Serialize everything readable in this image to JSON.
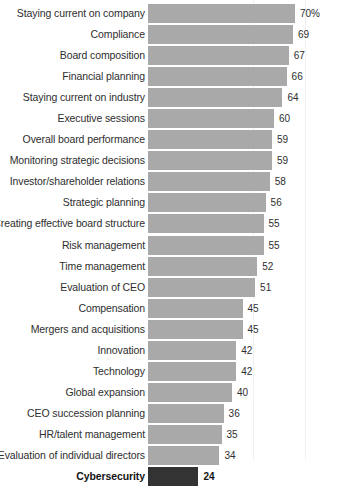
{
  "chart_data": {
    "type": "bar",
    "orientation": "horizontal",
    "title": "",
    "xlabel": "",
    "ylabel": "",
    "xlim": [
      0,
      70
    ],
    "grid": false,
    "legend": false,
    "value_suffix_first": "%",
    "highlight_category": "Cybersecurity",
    "colors": {
      "bar": "#a9a9a9",
      "bar_highlight": "#333333",
      "label_text": "#2e2e2e",
      "value_text": "#2e2e2e",
      "background": "#ffffff"
    },
    "categories": [
      "Staying current on company",
      "Compliance",
      "Board composition",
      "Financial planning",
      "Staying current on industry",
      "Executive sessions",
      "Overall board performance",
      "Monitoring strategic decisions",
      "Investor/shareholder relations",
      "Strategic planning",
      "Creating effective board structure",
      "Risk management",
      "Time management",
      "Evaluation of CEO",
      "Compensation",
      "Mergers and acquisitions",
      "Innovation",
      "Technology",
      "Global expansion",
      "CEO succession planning",
      "HR/talent management",
      "Evaluation of individual directors",
      "Cybersecurity"
    ],
    "values": [
      70,
      69,
      67,
      66,
      64,
      60,
      59,
      59,
      58,
      56,
      55,
      55,
      52,
      51,
      45,
      45,
      42,
      42,
      40,
      36,
      35,
      34,
      24
    ],
    "value_labels": [
      "70%",
      "69",
      "67",
      "66",
      "64",
      "60",
      "59",
      "59",
      "58",
      "56",
      "55",
      "55",
      "52",
      "51",
      "45",
      "45",
      "42",
      "42",
      "40",
      "36",
      "35",
      "34",
      "24"
    ]
  },
  "rows": [
    {
      "label": "Staying current on company",
      "value": 70,
      "value_label": "70%",
      "highlight": false
    },
    {
      "label": "Compliance",
      "value": 69,
      "value_label": "69",
      "highlight": false
    },
    {
      "label": "Board composition",
      "value": 67,
      "value_label": "67",
      "highlight": false
    },
    {
      "label": "Financial planning",
      "value": 66,
      "value_label": "66",
      "highlight": false
    },
    {
      "label": "Staying current on industry",
      "value": 64,
      "value_label": "64",
      "highlight": false
    },
    {
      "label": "Executive sessions",
      "value": 60,
      "value_label": "60",
      "highlight": false
    },
    {
      "label": "Overall board performance",
      "value": 59,
      "value_label": "59",
      "highlight": false
    },
    {
      "label": "Monitoring strategic decisions",
      "value": 59,
      "value_label": "59",
      "highlight": false
    },
    {
      "label": "Investor/shareholder relations",
      "value": 58,
      "value_label": "58",
      "highlight": false
    },
    {
      "label": "Strategic planning",
      "value": 56,
      "value_label": "56",
      "highlight": false
    },
    {
      "label": "Creating effective board structure",
      "value": 55,
      "value_label": "55",
      "highlight": false
    },
    {
      "label": "Risk management",
      "value": 55,
      "value_label": "55",
      "highlight": false
    },
    {
      "label": "Time management",
      "value": 52,
      "value_label": "52",
      "highlight": false
    },
    {
      "label": "Evaluation of CEO",
      "value": 51,
      "value_label": "51",
      "highlight": false
    },
    {
      "label": "Compensation",
      "value": 45,
      "value_label": "45",
      "highlight": false
    },
    {
      "label": "Mergers and acquisitions",
      "value": 45,
      "value_label": "45",
      "highlight": false
    },
    {
      "label": "Innovation",
      "value": 42,
      "value_label": "42",
      "highlight": false
    },
    {
      "label": "Technology",
      "value": 42,
      "value_label": "42",
      "highlight": false
    },
    {
      "label": "Global expansion",
      "value": 40,
      "value_label": "40",
      "highlight": false
    },
    {
      "label": "CEO succession planning",
      "value": 36,
      "value_label": "36",
      "highlight": false
    },
    {
      "label": "HR/talent management",
      "value": 35,
      "value_label": "35",
      "highlight": false
    },
    {
      "label": "Evaluation of individual directors",
      "value": 34,
      "value_label": "34",
      "highlight": false
    },
    {
      "label": "Cybersecurity",
      "value": 24,
      "value_label": "24",
      "highlight": true
    }
  ]
}
